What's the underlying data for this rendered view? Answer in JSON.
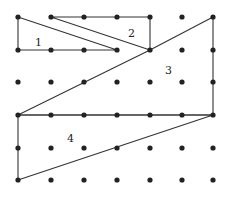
{
  "diagram": {
    "type": "dot-grid-shapes",
    "grid": {
      "columns_x": [
        18,
        51,
        84,
        117,
        150,
        182,
        213
      ],
      "rows_y": [
        17,
        50,
        82,
        115,
        148,
        180
      ],
      "dot_color": "#222222",
      "dot_radius": 2.6
    },
    "line_color": "#333333",
    "shapes": [
      {
        "label": "1",
        "points": [
          [
            0,
            0
          ],
          [
            0,
            1
          ],
          [
            3,
            1
          ]
        ],
        "label_pos": [
          35,
          46
        ]
      },
      {
        "label": "2",
        "points": [
          [
            1,
            0
          ],
          [
            4,
            0
          ],
          [
            4,
            1
          ]
        ],
        "label_pos": [
          128,
          37
        ]
      },
      {
        "label": "3",
        "points": [
          [
            4,
            1
          ],
          [
            6,
            0
          ],
          [
            6,
            3
          ],
          [
            0,
            3
          ]
        ],
        "label_pos": [
          165,
          74
        ]
      },
      {
        "label": "4",
        "points": [
          [
            0,
            3
          ],
          [
            6,
            3
          ],
          [
            0,
            5
          ]
        ],
        "label_pos": [
          67,
          142
        ]
      }
    ]
  }
}
